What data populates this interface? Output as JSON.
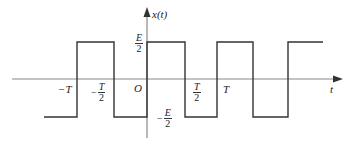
{
  "diagram": {
    "colors": {
      "axis": "#888888",
      "waveform": "#333333",
      "text": "#222222"
    },
    "axes": {
      "x_label": "t",
      "y_label": "x(t)",
      "origin_label": "O"
    },
    "tick_labels": {
      "neg_T": "−T",
      "neg_T_half": {
        "sign": "−",
        "num": "T",
        "den": "2"
      },
      "T_half": {
        "num": "T",
        "den": "2"
      },
      "T": "T",
      "E_half": {
        "num": "E",
        "den": "2"
      },
      "neg_E_half": {
        "sign": "−",
        "num": "E",
        "den": "2"
      }
    },
    "levels": {
      "high": "E/2",
      "low": "-E/2"
    },
    "transitions": [
      "-T",
      "-T/2",
      "0",
      "T/2",
      "T",
      "3T/2",
      "2T"
    ],
    "waveform_points": "44,117 77,117 77,42 114,42 114,117 147,117 147,42 185,42 185,117 217,117 217,42 253,42 253,117 288,117 288,42 323,42"
  }
}
